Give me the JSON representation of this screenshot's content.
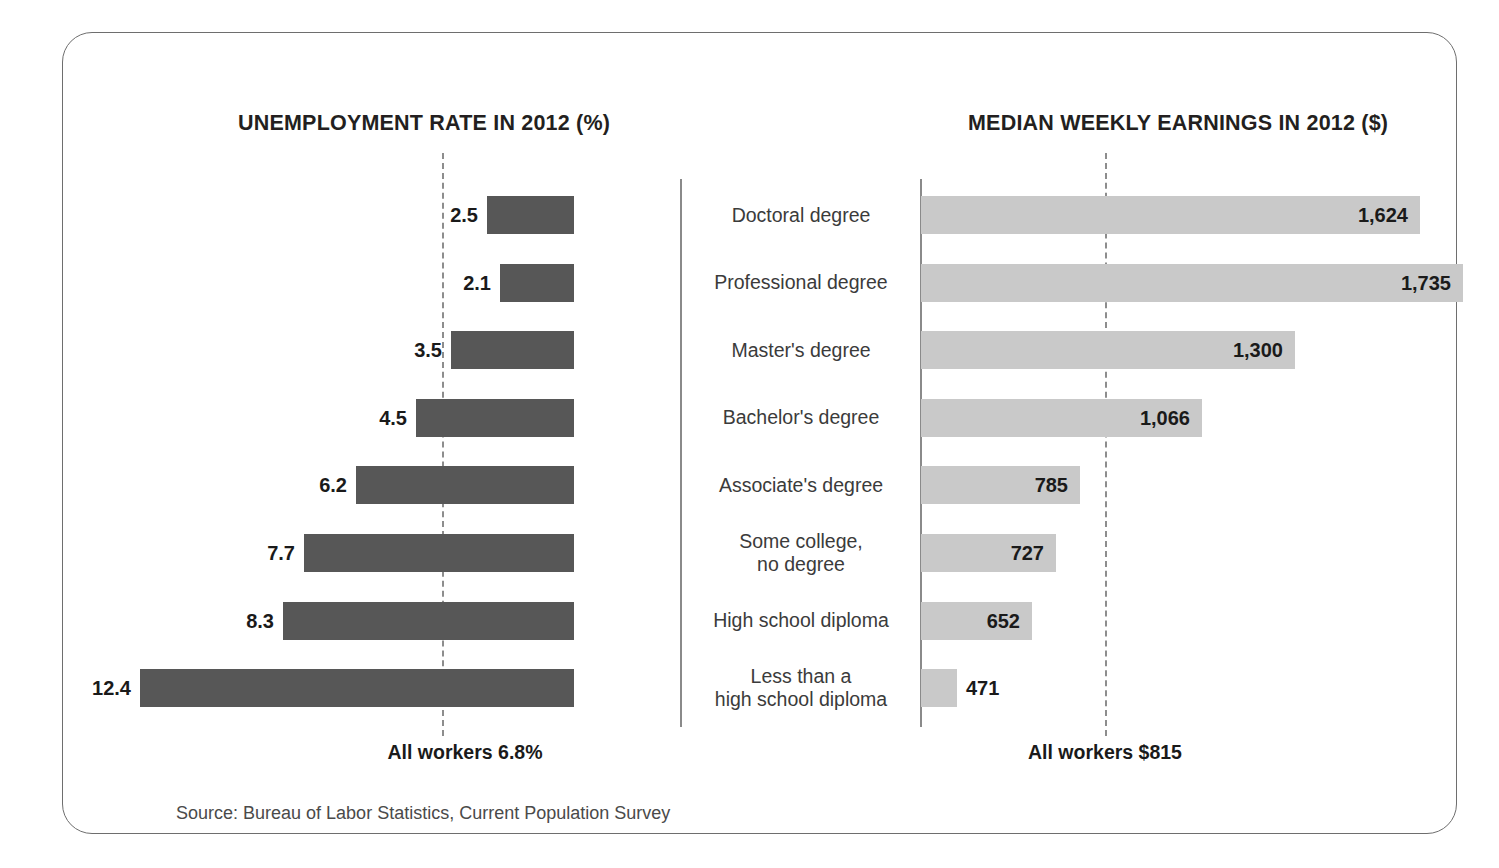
{
  "figure": {
    "source_note": "Source: Bureau of Labor Statistics, Current Population Survey",
    "left_panel_title": "UNEMPLOYMENT RATE IN 2012 (%)",
    "right_panel_title": "MEDIAN WEEKLY EARNINGS IN 2012 ($)",
    "left_reference_label": "All workers 6.8%",
    "right_reference_label": "All workers $815",
    "colors": {
      "unemployment_bar": "#575757",
      "earnings_bar": "#c9c9c9",
      "frame_border": "#6e6e6e",
      "reference_line": "#8d8d8d",
      "axis_spine": "#8a8a8a",
      "label_text": "#1a1a1a",
      "category_text": "#3b3b3b"
    }
  },
  "chart_data": {
    "type": "bar",
    "orientation": "horizontal",
    "layout": "back-to-back paired bar chart (diverging), shared category axis in center",
    "grid": false,
    "legend": "none",
    "categories": [
      "Doctoral degree",
      "Professional degree",
      "Master's degree",
      "Bachelor's degree",
      "Associate's degree",
      "Some college,\nno degree",
      "High school diploma",
      "Less than a\nhigh school diploma"
    ],
    "category_lines": [
      [
        "Doctoral degree"
      ],
      [
        "Professional degree"
      ],
      [
        "Master's degree"
      ],
      [
        "Bachelor's degree"
      ],
      [
        "Associate's degree"
      ],
      [
        "Some college,",
        "no degree"
      ],
      [
        "High school diploma"
      ],
      [
        "Less than a",
        "high school diploma"
      ]
    ],
    "series": [
      {
        "name": "Unemployment rate in 2012 (%)",
        "panel": "left",
        "direction": "leftward",
        "unit": "%",
        "values": [
          2.5,
          2.1,
          3.5,
          4.5,
          6.2,
          7.7,
          8.3,
          12.4
        ],
        "value_labels": [
          "2.5",
          "2.1",
          "3.5",
          "4.5",
          "6.2",
          "7.7",
          "8.3",
          "12.4"
        ],
        "label_position": "outside-end",
        "xlim": [
          0,
          12.4
        ],
        "reference_value": 6.8,
        "reference_label": "All workers 6.8%",
        "color": "#575757"
      },
      {
        "name": "Median weekly earnings in 2012 ($)",
        "panel": "right",
        "direction": "rightward",
        "unit": "$",
        "values": [
          1624,
          1735,
          1300,
          1066,
          785,
          727,
          652,
          471
        ],
        "value_labels": [
          "1,624",
          "1,735",
          "1,300",
          "1,066",
          "785",
          "727",
          "652",
          "471"
        ],
        "label_position": "inside-end (471 is outside)",
        "xlim": [
          0,
          1735
        ],
        "reference_value": 815,
        "reference_label": "All workers $815",
        "color": "#c9c9c9"
      }
    ],
    "rows": [
      {
        "category": "Doctoral degree",
        "unemployment": 2.5,
        "unemployment_label": "2.5",
        "earnings": 1624,
        "earnings_label": "1,624",
        "left_bar_px": 87,
        "right_bar_px": 499,
        "label_inside": true
      },
      {
        "category": "Professional degree",
        "unemployment": 2.1,
        "unemployment_label": "2.1",
        "earnings": 1735,
        "earnings_label": "1,735",
        "left_bar_px": 74,
        "right_bar_px": 542,
        "label_inside": true
      },
      {
        "category": "Master's degree",
        "unemployment": 3.5,
        "unemployment_label": "3.5",
        "earnings": 1300,
        "earnings_label": "1,300",
        "left_bar_px": 123,
        "right_bar_px": 374,
        "label_inside": true
      },
      {
        "category": "Bachelor's degree",
        "unemployment": 4.5,
        "unemployment_label": "4.5",
        "earnings": 1066,
        "earnings_label": "1,066",
        "left_bar_px": 158,
        "right_bar_px": 281,
        "label_inside": true
      },
      {
        "category": "Associate's degree",
        "unemployment": 6.2,
        "unemployment_label": "6.2",
        "earnings": 785,
        "earnings_label": "785",
        "left_bar_px": 218,
        "right_bar_px": 159,
        "label_inside": true
      },
      {
        "category": "Some college, no degree",
        "unemployment": 7.7,
        "unemployment_label": "7.7",
        "earnings": 727,
        "earnings_label": "727",
        "left_bar_px": 270,
        "right_bar_px": 135,
        "label_inside": true
      },
      {
        "category": "High school diploma",
        "unemployment": 8.3,
        "unemployment_label": "8.3",
        "earnings": 652,
        "earnings_label": "652",
        "left_bar_px": 291,
        "right_bar_px": 111,
        "label_inside": true
      },
      {
        "category": "Less than a high school diploma",
        "unemployment": 12.4,
        "unemployment_label": "12.4",
        "earnings": 471,
        "earnings_label": "471",
        "left_bar_px": 434,
        "right_bar_px": 36,
        "label_inside": false
      }
    ],
    "xlabel": "",
    "ylabel": ""
  }
}
